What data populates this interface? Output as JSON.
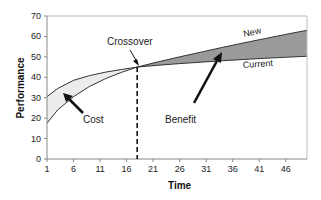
{
  "chart_data": {
    "type": "area",
    "title": "",
    "xlabel": "Time",
    "ylabel": "Performance",
    "xlim": [
      1,
      50
    ],
    "ylim": [
      0,
      70
    ],
    "x_ticks": [
      1,
      6,
      11,
      16,
      21,
      26,
      31,
      36,
      41,
      46
    ],
    "y_ticks": [
      0,
      10,
      20,
      30,
      40,
      50,
      60,
      70
    ],
    "grid": false,
    "legend": "none",
    "x": [
      1,
      3,
      6,
      9,
      12,
      15,
      18,
      22,
      26,
      30,
      34,
      38,
      42,
      46,
      50
    ],
    "series": [
      {
        "name": "Current",
        "values": [
          30.5,
          34.5,
          38.5,
          40.8,
          42.5,
          43.8,
          45.0,
          45.9,
          46.7,
          47.4,
          48.1,
          48.7,
          49.3,
          49.8,
          50.3
        ]
      },
      {
        "name": "New",
        "values": [
          17.5,
          24.0,
          30.5,
          35.5,
          39.3,
          42.4,
          45.0,
          47.6,
          50.0,
          52.3,
          54.6,
          56.8,
          58.9,
          61.0,
          63.0
        ]
      }
    ],
    "crossover": {
      "x": 18,
      "y": 45
    },
    "annotations": [
      {
        "text": "Crossover",
        "target": "crossover point"
      },
      {
        "text": "Cost",
        "target": "region between curves before crossover"
      },
      {
        "text": "Benefit",
        "target": "region between curves after crossover"
      },
      {
        "text": "New",
        "target": "upper curve after crossover"
      },
      {
        "text": "Current",
        "target": "lower curve after crossover"
      }
    ],
    "colors": {
      "cost_fill": "#ececec",
      "benefit_fill": "#9a9a9a",
      "line": "#333333",
      "axis": "#888888"
    }
  },
  "labels": {
    "crossover": "Crossover",
    "cost": "Cost",
    "benefit": "Benefit",
    "new": "New",
    "current": "Current",
    "xlabel": "Time",
    "ylabel": "Performance"
  }
}
